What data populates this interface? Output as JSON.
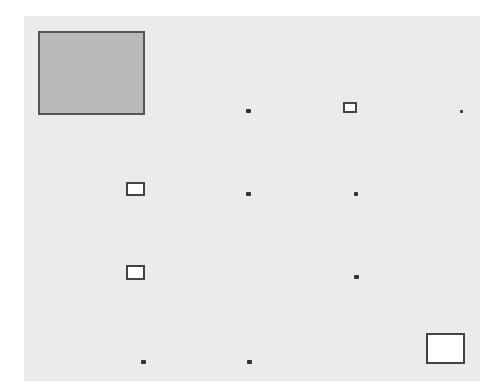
{
  "board": {
    "background": "#ebebeb",
    "x": 24,
    "y": 16,
    "width": 456,
    "height": 365
  },
  "pieces": [
    {
      "id": "player-block",
      "kind": "block",
      "x": 38,
      "y": 31,
      "w": 107,
      "h": 84,
      "color": "#b9b9b9"
    },
    {
      "id": "box-1",
      "kind": "target",
      "x": 343,
      "y": 102,
      "w": 14,
      "h": 11
    },
    {
      "id": "box-2",
      "kind": "target",
      "x": 126,
      "y": 182,
      "w": 19,
      "h": 14
    },
    {
      "id": "box-3",
      "kind": "target",
      "x": 126,
      "y": 265,
      "w": 19,
      "h": 15
    },
    {
      "id": "box-4",
      "kind": "target",
      "x": 426,
      "y": 333,
      "w": 39,
      "h": 31
    },
    {
      "id": "dot-1",
      "kind": "dot",
      "x": 246,
      "y": 109,
      "w": 5,
      "h": 4
    },
    {
      "id": "dot-2",
      "kind": "dot",
      "x": 460,
      "y": 110,
      "w": 3,
      "h": 3
    },
    {
      "id": "dot-3",
      "kind": "dot",
      "x": 246,
      "y": 192,
      "w": 5,
      "h": 4
    },
    {
      "id": "dot-4",
      "kind": "dot",
      "x": 354,
      "y": 192,
      "w": 4,
      "h": 4
    },
    {
      "id": "dot-5",
      "kind": "dot",
      "x": 354,
      "y": 275,
      "w": 5,
      "h": 4
    },
    {
      "id": "dot-6",
      "kind": "dot",
      "x": 141,
      "y": 360,
      "w": 5,
      "h": 4
    },
    {
      "id": "dot-7",
      "kind": "dot",
      "x": 247,
      "y": 360,
      "w": 5,
      "h": 4
    }
  ]
}
